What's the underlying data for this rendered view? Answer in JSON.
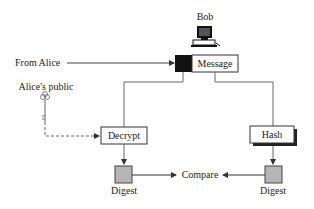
{
  "diagram": {
    "receiver_label": "Bob",
    "from_label": "From Alice",
    "key_label": "Alice's public",
    "message_label": "Message",
    "decrypt_label": "Decrypt",
    "hash_label": "Hash",
    "digest_left_label": "Digest",
    "digest_right_label": "Digest",
    "compare_label": "Compare"
  },
  "colors": {
    "line": "#555555",
    "digest_fill": "#b5b5b5",
    "signature_fill": "#111111",
    "shadow": "#222222"
  }
}
